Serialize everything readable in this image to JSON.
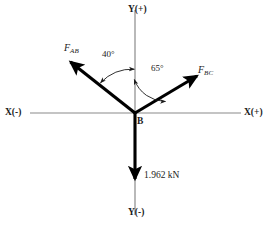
{
  "diagram": {
    "origin_point": "B",
    "axes": {
      "y_positive": "Y(+)",
      "y_negative": "Y(-)",
      "x_positive": "X(+)",
      "x_negative": "X(-)",
      "color": "#808080"
    },
    "vectors": [
      {
        "name": "F_AB",
        "label_main": "F",
        "label_sub": "AB",
        "direction_deg_from_y_positive": -40,
        "sense": "up-left",
        "color": "#000000"
      },
      {
        "name": "F_BC",
        "label_main": "F",
        "label_sub": "BC",
        "direction_deg_from_y_positive": 65,
        "sense": "up-right",
        "color": "#000000"
      },
      {
        "name": "applied-load",
        "label_main": "1.962 kN",
        "label_sub": "",
        "direction_deg_from_y_positive": 180,
        "sense": "down",
        "color": "#000000"
      }
    ],
    "angles": [
      {
        "name": "angle-fab",
        "value": "40°",
        "from": "Y(+)",
        "to": "F_AB"
      },
      {
        "name": "angle-fbc",
        "value": "65°",
        "from": "Y(+)",
        "to": "F_BC"
      }
    ],
    "magnitude": "1.962 kN"
  }
}
